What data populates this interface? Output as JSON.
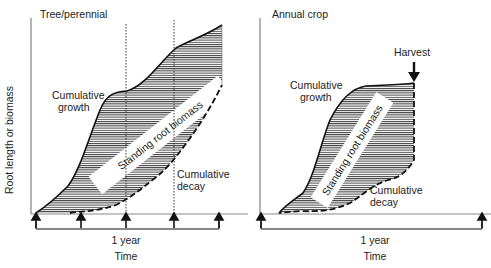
{
  "y_axis_label": "Root length or biomass",
  "panels": [
    {
      "title": "Tree/perennial",
      "growth_label_line1": "Cumulative",
      "growth_label_line2": "growth",
      "decay_label_line1": "Cumulative",
      "decay_label_line2": "decay",
      "band_label": "Standing root biomass",
      "period_label": "1 year",
      "x_axis_label": "Time",
      "sampling_arrows": 5
    },
    {
      "title": "Annual crop",
      "harvest_label": "Harvest",
      "growth_label_line1": "Cumulative",
      "growth_label_line2": "growth",
      "decay_label_line1": "Cumulative",
      "decay_label_line2": "decay",
      "band_label": "Standing root biomass",
      "period_label": "1 year",
      "x_axis_label": "Time",
      "sampling_arrows": 2
    }
  ],
  "colors": {
    "line": "#111111",
    "hatch": "#444444",
    "background": "#ffffff"
  }
}
